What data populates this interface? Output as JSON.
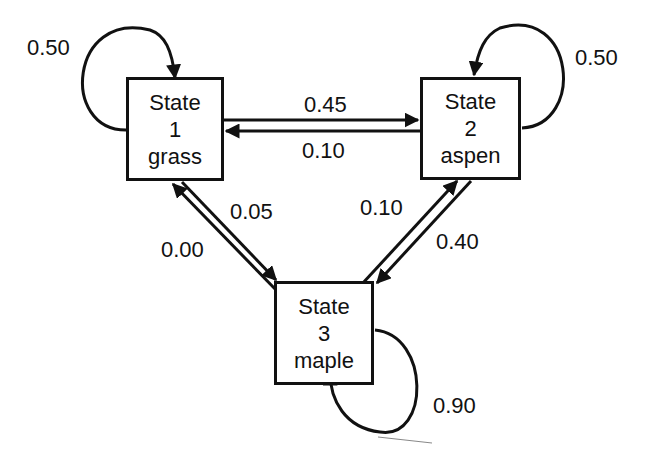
{
  "diagram": {
    "type": "state-transition-diagram",
    "states": [
      {
        "id": "1",
        "title": "State",
        "number": "1",
        "name": "grass"
      },
      {
        "id": "2",
        "title": "State",
        "number": "2",
        "name": "aspen"
      },
      {
        "id": "3",
        "title": "State",
        "number": "3",
        "name": "maple"
      }
    ],
    "transitions": [
      {
        "from": "1",
        "to": "1",
        "probability": "0.50"
      },
      {
        "from": "2",
        "to": "2",
        "probability": "0.50"
      },
      {
        "from": "3",
        "to": "3",
        "probability": "0.90"
      },
      {
        "from": "1",
        "to": "2",
        "probability": "0.45"
      },
      {
        "from": "2",
        "to": "1",
        "probability": "0.10"
      },
      {
        "from": "1",
        "to": "3",
        "probability": "0.05"
      },
      {
        "from": "3",
        "to": "1",
        "probability": "0.00"
      },
      {
        "from": "3",
        "to": "2",
        "probability": "0.10"
      },
      {
        "from": "2",
        "to": "3",
        "probability": "0.40"
      }
    ],
    "colors": {
      "ink": "#111111",
      "background": "#ffffff"
    }
  }
}
